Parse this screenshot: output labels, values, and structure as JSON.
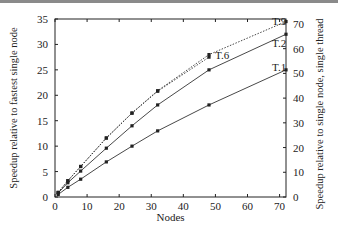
{
  "chart_data": {
    "type": "line",
    "title": "",
    "xlabel": "Nodes",
    "ylabel": "Speedup relative to fastest single node",
    "ylabel_right": "Speedup relative to single node, single thread",
    "xlim": [
      0,
      72
    ],
    "ylim": [
      0,
      35
    ],
    "ylim_right": [
      0,
      72
    ],
    "xticks": [
      0,
      10,
      20,
      30,
      40,
      50,
      60,
      70
    ],
    "yticks": [
      0,
      5,
      10,
      15,
      20,
      25,
      30,
      35
    ],
    "yticks_right": [
      0,
      10,
      20,
      30,
      40,
      50,
      60,
      70
    ],
    "grid": false,
    "legend": "inline labels at line ends",
    "x": [
      1,
      4,
      8,
      16,
      24,
      32,
      48,
      72
    ],
    "series": [
      {
        "name": "T.1",
        "style": "solid",
        "x": [
          1,
          4,
          8,
          16,
          24,
          32,
          48,
          72
        ],
        "values": [
          0.5,
          1.9,
          3.5,
          6.9,
          10.0,
          13.0,
          18.1,
          25.0
        ]
      },
      {
        "name": "T.2",
        "style": "solid",
        "x": [
          1,
          4,
          8,
          16,
          24,
          32,
          48,
          72
        ],
        "values": [
          0.8,
          2.8,
          5.1,
          9.6,
          14.0,
          18.1,
          25.0,
          32.0
        ]
      },
      {
        "name": "T.6",
        "style": "dotted",
        "x": [
          1,
          4,
          8,
          16,
          24,
          32,
          48
        ],
        "values": [
          0.9,
          3.2,
          6.0,
          11.6,
          16.5,
          20.8,
          27.5
        ]
      },
      {
        "name": "T.9",
        "style": "dotted",
        "x": [
          1,
          4,
          8,
          16,
          24,
          32,
          48,
          72
        ],
        "values": [
          0.9,
          3.2,
          6.0,
          11.6,
          16.5,
          20.9,
          28.0,
          34.5
        ]
      }
    ],
    "annotations": [
      "T.9",
      "T.2",
      "T.6",
      "T.1"
    ]
  }
}
